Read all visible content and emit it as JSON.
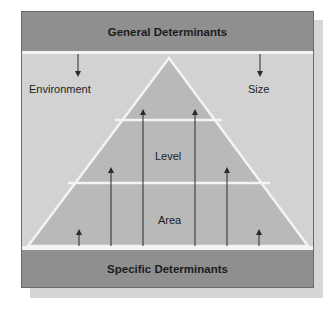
{
  "diagram": {
    "top_band": {
      "label": "General Determinants"
    },
    "bottom_band": {
      "label": "Specific Determinants"
    },
    "side_labels": {
      "left": "Environment",
      "right": "Size"
    },
    "pyramid_tiers": [
      {
        "label": ""
      },
      {
        "label": "Level"
      },
      {
        "label": "Area"
      }
    ],
    "colors": {
      "band": "#8f8f8f",
      "background": "#d2d2d2",
      "pyramid": "#b9b9b9",
      "divider": "#f4f4f4",
      "arrow": "#2a2a2a"
    }
  }
}
